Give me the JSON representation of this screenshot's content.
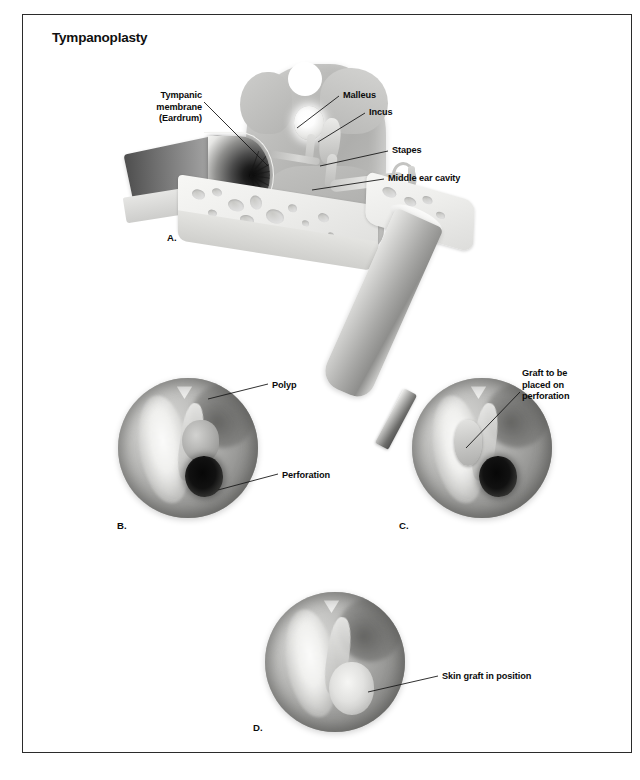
{
  "figure": {
    "title": "Tympanoplasty"
  },
  "panels": {
    "a": {
      "letter": "A.",
      "labels": {
        "tympanic_membrane": "Tympanic\nmembrane\n(Eardrum)",
        "malleus": "Malleus",
        "incus": "Incus",
        "stapes": "Stapes",
        "middle_ear_cavity": "Middle ear cavity"
      }
    },
    "b": {
      "letter": "B.",
      "labels": {
        "polyp": "Polyp",
        "perforation": "Perforation"
      }
    },
    "c": {
      "letter": "C.",
      "labels": {
        "graft": "Graft to be\nplaced on\nperforation"
      }
    },
    "d": {
      "letter": "D.",
      "labels": {
        "skin_graft": "Skin graft in position"
      }
    }
  },
  "colors": {
    "frame": "#2b2b2b",
    "text": "#0c0c0c",
    "leader": "#1a1a1a",
    "background": "#ffffff"
  }
}
